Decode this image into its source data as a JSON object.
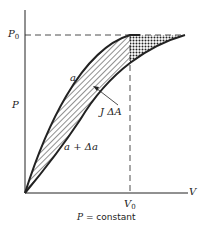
{
  "diagram": {
    "axes": {
      "y_label": "P",
      "x_label": "V",
      "y_tick": {
        "base": "P",
        "sub": "0"
      },
      "x_tick": {
        "base": "V",
        "sub": "0"
      }
    },
    "curves": [
      {
        "label": "a",
        "description": "upper curve reaching P0 at V0"
      },
      {
        "label": "a + Δa",
        "description": "lower curve reaching P0 beyond V0"
      }
    ],
    "regions": [
      {
        "label": "J ΔA",
        "pattern": "diagonal-hatch",
        "description": "area between curves for V < V0"
      },
      {
        "pattern": "cross-hatch",
        "description": "area between curves above V0 up to P0"
      }
    ],
    "caption": {
      "var": "P",
      "text": " = constant"
    },
    "colors": {
      "line": "#222222",
      "background": "#ffffff"
    }
  }
}
